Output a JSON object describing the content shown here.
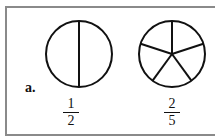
{
  "problem_label": "a.",
  "figures": [
    {
      "shape": "circle",
      "parts": 2,
      "fraction": {
        "numerator": "1",
        "denominator": "2"
      }
    },
    {
      "shape": "circle",
      "parts": 5,
      "fraction": {
        "numerator": "2",
        "denominator": "5"
      }
    }
  ]
}
